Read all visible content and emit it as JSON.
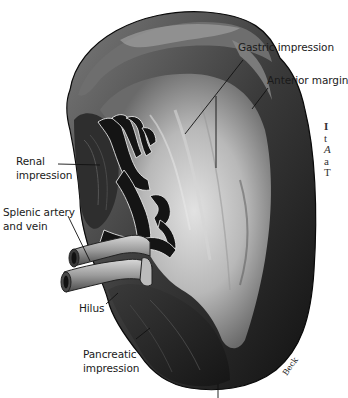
{
  "figure": {
    "labels": {
      "gastric_impression": "Gastric impression",
      "anterior_margin": "Anterior margin",
      "renal_impression_1": "Renal",
      "renal_impression_2": "impression",
      "splenic_vessels_1": "Splenic artery",
      "splenic_vessels_2": "and vein",
      "hilus": "Hilus",
      "pancreatic_impression_1": "Pancreatic",
      "pancreatic_impression_2": "impression"
    },
    "signature": "Beck",
    "side_text_fragments": [
      "I",
      "t",
      "A",
      "a",
      "T"
    ],
    "colors": {
      "background": "#ffffff",
      "organ_dark": "#1c1c1c",
      "organ_mid": "#5a5a5a",
      "organ_light": "#c8c8c8",
      "label_text": "#1a1a1a",
      "leader_line": "#111111"
    }
  }
}
